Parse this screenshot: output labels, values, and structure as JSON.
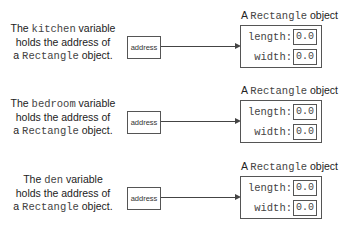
{
  "rows": [
    {
      "variable": "kitchen",
      "desc_pre": "The ",
      "desc_post": " variable",
      "line2": "holds the address of",
      "line3_pre": "a ",
      "line3_class": "Rectangle",
      "line3_post": " object.",
      "address_label": "address",
      "object_caption_pre": "A ",
      "object_caption_class": "Rectangle",
      "object_caption_post": " object",
      "fields": [
        {
          "name": "length:",
          "value": "0.0"
        },
        {
          "name": "width:",
          "value": "0.0"
        }
      ]
    },
    {
      "variable": "bedroom",
      "desc_pre": "The ",
      "desc_post": " variable",
      "line2": "holds the address of",
      "line3_pre": "a ",
      "line3_class": "Rectangle",
      "line3_post": " object.",
      "address_label": "address",
      "object_caption_pre": "A ",
      "object_caption_class": "Rectangle",
      "object_caption_post": " object",
      "fields": [
        {
          "name": "length:",
          "value": "0.0"
        },
        {
          "name": "width:",
          "value": "0.0"
        }
      ]
    },
    {
      "variable": "den",
      "desc_pre": "The ",
      "desc_post": " variable",
      "line2": "holds the address of",
      "line3_pre": "a ",
      "line3_class": "Rectangle",
      "line3_post": " object.",
      "address_label": "address",
      "object_caption_pre": "A ",
      "object_caption_class": "Rectangle",
      "object_caption_post": " object",
      "fields": [
        {
          "name": "length:",
          "value": "0.0"
        },
        {
          "name": "width:",
          "value": "0.0"
        }
      ]
    }
  ]
}
